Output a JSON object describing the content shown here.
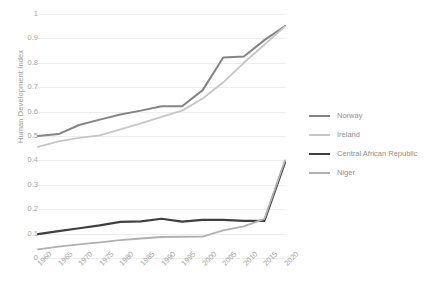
{
  "chart_data": {
    "type": "line",
    "title": "",
    "xlabel": "",
    "ylabel": "Human Development Index",
    "x": [
      1960,
      1965,
      1970,
      1975,
      1980,
      1985,
      1990,
      1995,
      2000,
      2005,
      2010,
      2015,
      2020
    ],
    "categories": [
      "1960",
      "1965",
      "1970",
      "1975",
      "1980",
      "1985",
      "1990",
      "1995",
      "2000",
      "2005",
      "2010",
      "2015",
      "2020"
    ],
    "xlim": [
      1960,
      2020
    ],
    "ylim": [
      0,
      1
    ],
    "y_ticks": [
      "0",
      "0.1",
      "0.2",
      "0.3",
      "0.4",
      "0.5",
      "0.6",
      "0.7",
      "0.8",
      "0.9",
      "1"
    ],
    "y_tick_values": [
      0,
      0.1,
      0.2,
      0.3,
      0.4,
      0.5,
      0.6,
      0.7,
      0.8,
      0.9,
      1
    ],
    "grid": "horizontal",
    "legend_position": "right",
    "series": [
      {
        "name": "Norway",
        "color": "#848484",
        "width": 2.0,
        "values": [
          0.5,
          0.508,
          0.545,
          0.567,
          0.588,
          0.604,
          0.622,
          0.622,
          0.688,
          0.822,
          0.826,
          0.893,
          0.951
        ]
      },
      {
        "name": "Ireland",
        "color": "#c6c6c6",
        "width": 1.8,
        "values": [
          0.455,
          0.478,
          0.492,
          0.503,
          0.527,
          0.552,
          0.578,
          0.604,
          0.654,
          0.72,
          0.8,
          0.874,
          0.949
        ]
      },
      {
        "name": "Central African Republic",
        "color": "#3f3f3f",
        "width": 2.2,
        "values": [
          0.098,
          0.11,
          0.122,
          0.134,
          0.148,
          0.15,
          0.161,
          0.149,
          0.156,
          0.156,
          0.152,
          0.152,
          0.392
        ]
      },
      {
        "name": "Niger",
        "color": "#b0b0b0",
        "width": 1.8,
        "values": [
          0.035,
          0.047,
          0.056,
          0.064,
          0.073,
          0.08,
          0.086,
          0.087,
          0.088,
          0.113,
          0.13,
          0.16,
          0.4
        ]
      }
    ]
  },
  "legend": {
    "items": [
      {
        "label": "Norway"
      },
      {
        "label": "Ireland"
      },
      {
        "label": "Central African Republic"
      },
      {
        "label": "Niger"
      }
    ]
  }
}
